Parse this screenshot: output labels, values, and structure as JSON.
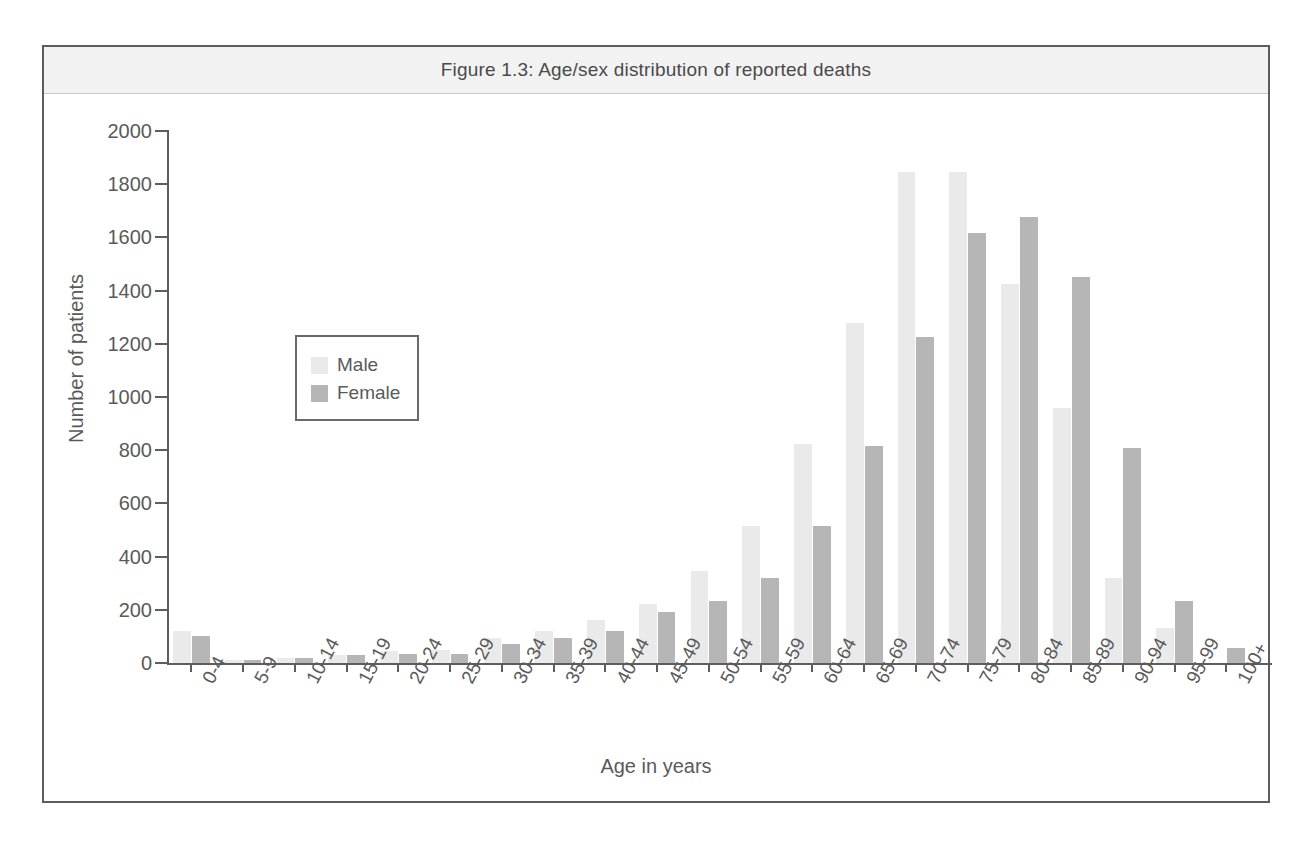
{
  "figure": {
    "title": "Figure 1.3: Age/sex distribution of reported deaths",
    "frame_border_color": "#5d5d5d",
    "title_band_color": "#f2f2f2"
  },
  "legend": {
    "position": "inside-left",
    "entries": [
      {
        "label": "Male",
        "color": "#eaeaea"
      },
      {
        "label": "Female",
        "color": "#b6b6b6"
      }
    ]
  },
  "chart_data": {
    "type": "bar",
    "title": "Figure 1.3: Age/sex distribution of reported deaths",
    "xlabel": "Age in years",
    "ylabel": "Number of patients",
    "ylim": [
      0,
      2000
    ],
    "ytick_labels": [
      "2000",
      "1800",
      "1600",
      "1400",
      "1200",
      "1000",
      "800",
      "600",
      "400",
      "200",
      "0"
    ],
    "yticks": [
      2000,
      1800,
      1600,
      1400,
      1200,
      1000,
      800,
      600,
      400,
      200,
      0
    ],
    "grid": false,
    "legend_position": "inside-left",
    "categories": [
      "0-4",
      "5-9",
      "10-14",
      "15-19",
      "20-24",
      "25-29",
      "30-34",
      "35-39",
      "40-44",
      "45-49",
      "50-54",
      "55-59",
      "60-64",
      "65-69",
      "70-74",
      "75-79",
      "80-84",
      "85-89",
      "90-94",
      "95-99",
      "100+"
    ],
    "series": [
      {
        "name": "Male",
        "color": "#eaeaea",
        "values": [
          120,
          10,
          18,
          30,
          45,
          50,
          95,
          120,
          160,
          220,
          345,
          515,
          825,
          1280,
          1845,
          1845,
          1425,
          960,
          320,
          130,
          0
        ]
      },
      {
        "name": "Female",
        "color": "#b6b6b6",
        "values": [
          100,
          12,
          20,
          30,
          35,
          35,
          70,
          95,
          120,
          190,
          235,
          320,
          515,
          815,
          1225,
          1615,
          1675,
          1450,
          810,
          235,
          55
        ]
      }
    ]
  }
}
